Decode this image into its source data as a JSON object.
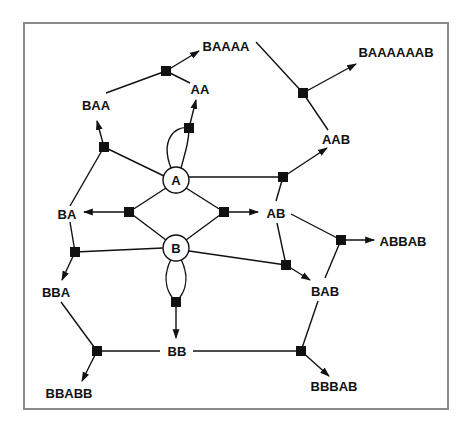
{
  "diagram": {
    "type": "word-rewriting graph",
    "circle_nodes": [
      {
        "id": "A",
        "label": "A"
      },
      {
        "id": "B",
        "label": "B"
      }
    ],
    "word_nodes": [
      {
        "id": "BAAAA",
        "label": "BAAAA"
      },
      {
        "id": "BAAAAAAB",
        "label": "BAAAAAAB"
      },
      {
        "id": "BAA",
        "label": "BAA"
      },
      {
        "id": "AA",
        "label": "AA"
      },
      {
        "id": "AAB",
        "label": "AAB"
      },
      {
        "id": "BA",
        "label": "BA"
      },
      {
        "id": "AB",
        "label": "AB"
      },
      {
        "id": "ABBAB",
        "label": "ABBAB"
      },
      {
        "id": "BBA",
        "label": "BBA"
      },
      {
        "id": "BAB",
        "label": "BAB"
      },
      {
        "id": "BB",
        "label": "BB"
      },
      {
        "id": "BBABB",
        "label": "BBABB"
      },
      {
        "id": "BBBAB",
        "label": "BBBAB"
      }
    ],
    "rules": [
      {
        "inputs": [
          "A",
          "A"
        ],
        "output": "AA"
      },
      {
        "inputs": [
          "B",
          "B"
        ],
        "output": "BB"
      },
      {
        "inputs": [
          "A",
          "B"
        ],
        "output": "AB"
      },
      {
        "inputs": [
          "B",
          "A"
        ],
        "output": "BA"
      },
      {
        "inputs": [
          "BA",
          "A"
        ],
        "output": "BAA"
      },
      {
        "inputs": [
          "BAA",
          "AA"
        ],
        "output": "BAAAA"
      },
      {
        "inputs": [
          "A",
          "AB"
        ],
        "output": "AAB"
      },
      {
        "inputs": [
          "BAAAA",
          "AAB"
        ],
        "output": "BAAAAAAB"
      },
      {
        "inputs": [
          "BA",
          "B"
        ],
        "output": "BBA"
      },
      {
        "inputs": [
          "B",
          "AB"
        ],
        "output": "BAB"
      },
      {
        "inputs": [
          "AB",
          "BAB"
        ],
        "output": "ABBAB"
      },
      {
        "inputs": [
          "BBA",
          "BB"
        ],
        "output": "BBABB"
      },
      {
        "inputs": [
          "BB",
          "BAB"
        ],
        "output": "BBBAB"
      }
    ]
  }
}
